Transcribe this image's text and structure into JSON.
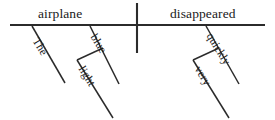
{
  "diagram": {
    "type": "reed-kellogg-sentence-diagram",
    "sentence": "The blue light airplane disappeared very quickly",
    "stroke_color": "#2b2b2b",
    "background_color": "#ffffff",
    "baseline": {
      "label": "main-horizontal-baseline",
      "x1": 10,
      "y1": 25,
      "x2": 265,
      "y2": 25
    },
    "divider": {
      "label": "subject-predicate-divider",
      "x1": 137,
      "y1": 3,
      "x2": 137,
      "y2": 53
    },
    "subject": {
      "word": "airplane",
      "role": "subject-noun"
    },
    "predicate": {
      "word": "disappeared",
      "role": "predicate-verb"
    },
    "modifiers": [
      {
        "word": "The",
        "role": "article-modifying-subject",
        "attaches_to": "airplane",
        "line": {
          "x1": 32,
          "y1": 26,
          "x2": 65,
          "y2": 83
        }
      },
      {
        "word": "blue",
        "role": "adjective-modifying-subject",
        "attaches_to": "airplane",
        "line": {
          "x1": 90,
          "y1": 26,
          "x2": 119,
          "y2": 84
        }
      },
      {
        "word": "light",
        "role": "adjective-modifying-blue",
        "attaches_to": "blue",
        "connector": {
          "x1": 77,
          "y1": 60,
          "x2": 103,
          "y2": 48
        },
        "line": {
          "x1": 77,
          "y1": 60,
          "x2": 113,
          "y2": 118
        }
      },
      {
        "word": "quickly",
        "role": "adverb-modifying-predicate",
        "attaches_to": "disappeared",
        "line": {
          "x1": 206,
          "y1": 26,
          "x2": 239,
          "y2": 84
        }
      },
      {
        "word": "very",
        "role": "adverb-modifying-quickly",
        "attaches_to": "quickly",
        "connector": {
          "x1": 193,
          "y1": 60,
          "x2": 219,
          "y2": 48
        },
        "line": {
          "x1": 193,
          "y1": 60,
          "x2": 229,
          "y2": 118
        }
      }
    ]
  }
}
